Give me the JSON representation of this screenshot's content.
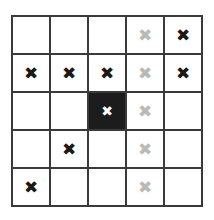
{
  "figure": {
    "rows": 5,
    "columns": 5,
    "mark_glyph": "✖",
    "colors": {
      "background": "#ffffff",
      "grid_line": "#3a3a3a",
      "cell_fill": "#ffffff",
      "highlight_cell_fill": "#1c1c1c",
      "mark_black": "#1a1a1a",
      "mark_gray": "#b9b9b9",
      "mark_white": "#ffffff"
    }
  },
  "chart_data": {
    "type": "heatmap",
    "xlabel": "",
    "ylabel": "",
    "categories": [
      "c1",
      "c2",
      "c3",
      "c4",
      "c5"
    ],
    "row_labels": [
      "r1",
      "r2",
      "r3",
      "r4",
      "r5"
    ],
    "legend": [
      {
        "name": "black cross",
        "color": "#1a1a1a"
      },
      {
        "name": "gray cross",
        "color": "#b9b9b9"
      },
      {
        "name": "white cross on filled cell",
        "color": "#ffffff"
      },
      {
        "name": "empty cell",
        "color": "#ffffff"
      }
    ],
    "cells": [
      [
        {
          "mark": "none",
          "glyph": "",
          "fill": "empty"
        },
        {
          "mark": "none",
          "glyph": "",
          "fill": "empty"
        },
        {
          "mark": "none",
          "glyph": "",
          "fill": "empty"
        },
        {
          "mark": "gray",
          "glyph": "✖",
          "fill": "empty"
        },
        {
          "mark": "black",
          "glyph": "✖",
          "fill": "empty"
        }
      ],
      [
        {
          "mark": "black",
          "glyph": "✖",
          "fill": "empty"
        },
        {
          "mark": "black",
          "glyph": "✖",
          "fill": "empty"
        },
        {
          "mark": "black",
          "glyph": "✖",
          "fill": "empty"
        },
        {
          "mark": "gray",
          "glyph": "✖",
          "fill": "empty"
        },
        {
          "mark": "black",
          "glyph": "✖",
          "fill": "empty"
        }
      ],
      [
        {
          "mark": "none",
          "glyph": "",
          "fill": "empty"
        },
        {
          "mark": "none",
          "glyph": "",
          "fill": "empty"
        },
        {
          "mark": "white",
          "glyph": "✖",
          "fill": "filled"
        },
        {
          "mark": "gray",
          "glyph": "✖",
          "fill": "empty"
        },
        {
          "mark": "none",
          "glyph": "",
          "fill": "empty"
        }
      ],
      [
        {
          "mark": "none",
          "glyph": "",
          "fill": "empty"
        },
        {
          "mark": "black",
          "glyph": "✖",
          "fill": "empty"
        },
        {
          "mark": "none",
          "glyph": "",
          "fill": "empty"
        },
        {
          "mark": "gray",
          "glyph": "✖",
          "fill": "empty"
        },
        {
          "mark": "none",
          "glyph": "",
          "fill": "empty"
        }
      ],
      [
        {
          "mark": "black",
          "glyph": "✖",
          "fill": "empty"
        },
        {
          "mark": "none",
          "glyph": "",
          "fill": "empty"
        },
        {
          "mark": "none",
          "glyph": "",
          "fill": "empty"
        },
        {
          "mark": "gray",
          "glyph": "✖",
          "fill": "empty"
        },
        {
          "mark": "none",
          "glyph": "",
          "fill": "empty"
        }
      ]
    ],
    "values": [
      [
        0,
        0,
        0,
        0.5,
        1
      ],
      [
        1,
        1,
        1,
        0.5,
        1
      ],
      [
        0,
        0,
        2,
        0.5,
        0
      ],
      [
        0,
        1,
        0,
        0.5,
        0
      ],
      [
        1,
        0,
        0,
        0.5,
        0
      ]
    ],
    "value_legend": {
      "0": "empty",
      "0.5": "gray cross",
      "1": "black cross",
      "2": "white cross on dark cell"
    },
    "grid": true,
    "legend_position": "none"
  }
}
